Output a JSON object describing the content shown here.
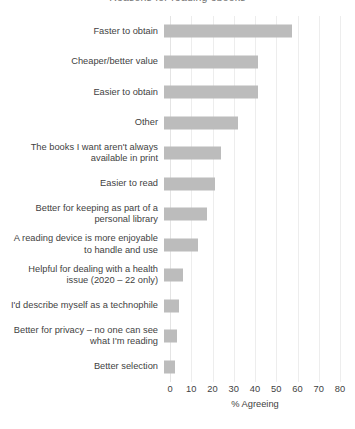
{
  "chart_data": {
    "type": "bar",
    "orientation": "horizontal",
    "title": "Reasons for reading ebooks",
    "xlabel": "% Agreeing",
    "ylabel": "",
    "xlim": [
      0,
      80
    ],
    "xticks": [
      0,
      10,
      20,
      30,
      40,
      50,
      60,
      70,
      80
    ],
    "xtick_labels": [
      "0",
      "10",
      "20",
      "30",
      "40",
      "50",
      "60",
      "70",
      "80"
    ],
    "grid": true,
    "legend": false,
    "bar_color": "#bcbcbc",
    "categories": [
      "Faster to obtain",
      "Cheaper/better value",
      "Easier to obtain",
      "Other",
      "The books I want aren't always\navailable in print",
      "Easier to read",
      "Better for keeping as part of a\npersonal library",
      "A reading device is more enjoyable\nto handle and use",
      "Helpful for dealing with a health\nissue (2020 – 22 only)",
      "I'd describe myself as a technophile",
      "Better for privacy – no one can see\nwhat I'm reading",
      "Better selection"
    ],
    "values": [
      60,
      44,
      44,
      35,
      27,
      24,
      20,
      16,
      9,
      7,
      6,
      5
    ],
    "textured_bars": [
      4
    ]
  }
}
